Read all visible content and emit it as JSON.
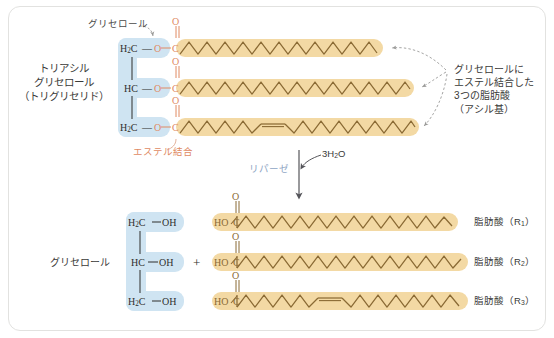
{
  "figure": {
    "title_left": "トリアシル\nグリセロール\n（トリグリセリド）",
    "glycerol_callout": "グリセロール",
    "ester_bond_label": "エステル結合",
    "enzyme_label": "リパーゼ",
    "water_label": "3H2O",
    "right_annotation": "グリセロールに\nエステル結合した\n3つの脂肪酸\n（アシル基）",
    "product_glycerol_label": "グリセロール",
    "plus_sign": "＋"
  },
  "glycerol_top": {
    "rows": [
      {
        "carbon": "H2C",
        "bond": "—",
        "oxygen": "O"
      },
      {
        "carbon": "HC",
        "bond": "—",
        "oxygen": "O"
      },
      {
        "carbon": "H2C",
        "bond": "—",
        "oxygen": "O"
      }
    ]
  },
  "glycerol_bottom": {
    "rows": [
      {
        "carbon": "H2C",
        "bond": "—",
        "hydroxyl": "OH"
      },
      {
        "carbon": "HC",
        "bond": "—",
        "hydroxyl": "OH"
      },
      {
        "carbon": "H2C",
        "bond": "—",
        "hydroxyl": "OH"
      }
    ]
  },
  "carbonyls_top": {
    "oxygen": "O",
    "carbon": "C",
    "count": 3
  },
  "carboxyls_bottom": {
    "hydroxyl": "HO",
    "carbon": "C",
    "oxygen": "O",
    "count": 3
  },
  "fatty_acid_labels": [
    "脂肪酸（R1）",
    "脂肪酸（R2）",
    "脂肪酸（R3）"
  ],
  "chains_top": [
    {
      "id": "chain-1-saturated",
      "end_x": 383,
      "double_bond": false
    },
    {
      "id": "chain-2-saturated",
      "end_x": 414,
      "double_bond": false
    },
    {
      "id": "chain-3-unsaturated",
      "end_x": 419,
      "double_bond": true
    }
  ],
  "chains_bottom": [
    {
      "id": "product-chain-1-saturated",
      "end_x": 458,
      "double_bond": false
    },
    {
      "id": "product-chain-2-saturated",
      "end_x": 468,
      "double_bond": false
    },
    {
      "id": "product-chain-3-unsaturated",
      "end_x": 468,
      "double_bond": true
    }
  ],
  "colors": {
    "chain_fill": "#f3d9a4",
    "chain_stroke": "#8a6a34",
    "glycerol_highlight": "#cfe4f2",
    "oxygen_orange": "#e08a63",
    "atom_dark": "#2f2f2d",
    "arrow_gray": "#9a9a98",
    "enzyme_blue": "#8fa6c4",
    "frame_border": "#e2e2e0",
    "background": "#ffffff"
  }
}
